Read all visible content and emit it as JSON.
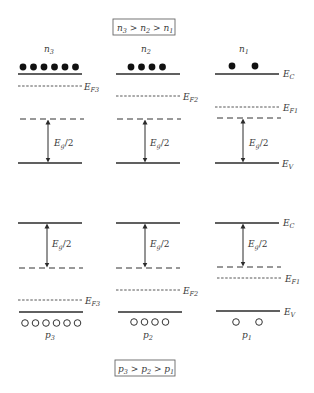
{
  "top_panel": {
    "title_box": {
      "main": [
        "n",
        "3",
        " > ",
        "n",
        "2",
        " > ",
        "n",
        "1"
      ],
      "text": "n3 > n2 > n1"
    },
    "columns": [
      {
        "carrier_label": "n",
        "carrier_sub": "3",
        "electron_count": 6,
        "fermi_label": "E",
        "fermi_sub": "F3"
      },
      {
        "carrier_label": "n",
        "carrier_sub": "2",
        "electron_count": 4,
        "fermi_label": "E",
        "fermi_sub": "F2"
      },
      {
        "carrier_label": "n",
        "carrier_sub": "1",
        "electron_count": 2,
        "fermi_label": "E",
        "fermi_sub": "F1"
      }
    ],
    "band_labels": {
      "conduction": "E",
      "conduction_sub": "C",
      "valence": "E",
      "valence_sub": "V"
    },
    "gap_label": {
      "main": "E",
      "sub": "g",
      "tail": "/2"
    }
  },
  "bottom_panel": {
    "title_box": {
      "text": "p3 > p2 > p1"
    },
    "columns": [
      {
        "carrier_label": "p",
        "carrier_sub": "3",
        "hole_count": 6,
        "fermi_label": "E",
        "fermi_sub": "F3"
      },
      {
        "carrier_label": "p",
        "carrier_sub": "2",
        "hole_count": 4,
        "fermi_label": "E",
        "fermi_sub": "F2"
      },
      {
        "carrier_label": "p",
        "carrier_sub": "1",
        "hole_count": 2,
        "fermi_label": "E",
        "fermi_sub": "F1"
      }
    ],
    "band_labels": {
      "conduction": "E",
      "conduction_sub": "C",
      "valence": "E",
      "valence_sub": "V"
    },
    "gap_label": {
      "main": "E",
      "sub": "g",
      "tail": "/2"
    }
  },
  "colors": {
    "line": "#2b2b2b",
    "text": "#3a3a3a",
    "box_border": "#555555"
  }
}
